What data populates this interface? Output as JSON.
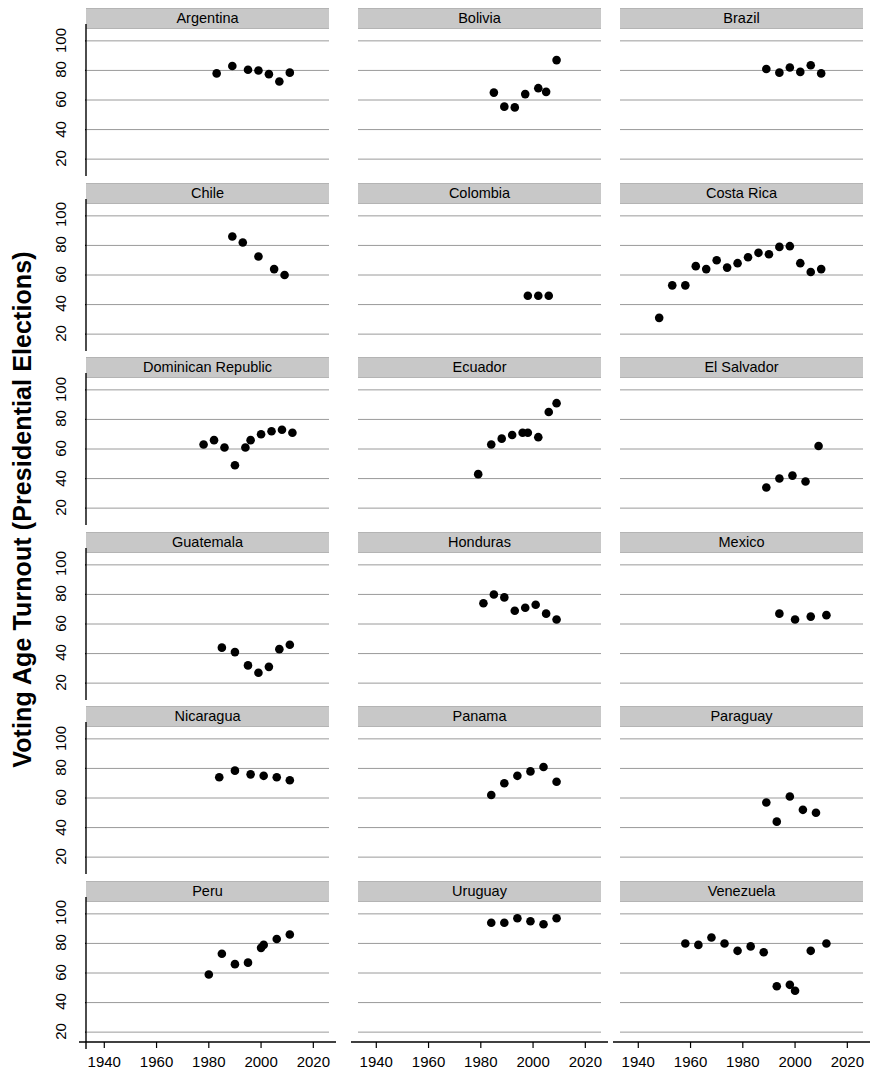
{
  "figure": {
    "ylabel": "Voting Age Turnout (Presidential Elections)",
    "xlabel": "",
    "strip_color": "#c8c8c8",
    "point_color": "#000000",
    "grid_color": "#808080",
    "background": "#ffffff"
  },
  "axis": {
    "y_ticks": [
      "20",
      "40",
      "60",
      "80",
      "100"
    ],
    "x_ticks": [
      "1940",
      "1960",
      "1980",
      "2000",
      "2020"
    ],
    "ylim": [
      14,
      106
    ],
    "xlim": [
      1933,
      2026
    ]
  },
  "chart_data": {
    "type": "scatter",
    "title": "",
    "xlabel": "",
    "ylabel": "Voting Age Turnout (Presidential Elections)",
    "xlim": [
      1933,
      2026
    ],
    "ylim": [
      14,
      106
    ],
    "xticks": [
      1940,
      1960,
      1980,
      2000,
      2020
    ],
    "yticks": [
      20,
      40,
      60,
      80,
      100
    ],
    "grid": true,
    "legend": "none",
    "layout": {
      "rows": 6,
      "cols": 3,
      "panel_order": "row-major"
    },
    "panels": [
      {
        "name": "Argentina",
        "x": [
          1983,
          1989,
          1995,
          1999,
          2003,
          2007,
          2011
        ],
        "y": [
          78,
          83,
          80.5,
          80,
          77.5,
          72.5,
          78.5
        ]
      },
      {
        "name": "Bolivia",
        "x": [
          1985,
          1989,
          1993,
          1997,
          2002,
          2005,
          2009
        ],
        "y": [
          65,
          55.5,
          55,
          64,
          68,
          65.5,
          87
        ]
      },
      {
        "name": "Brazil",
        "x": [
          1989,
          1994,
          1998,
          2002,
          2006,
          2010
        ],
        "y": [
          81,
          78.5,
          82,
          79,
          83.5,
          78
        ]
      },
      {
        "name": "Chile",
        "x": [
          1989,
          1993,
          1999,
          2005,
          2009
        ],
        "y": [
          86,
          82,
          72.5,
          64,
          60
        ]
      },
      {
        "name": "Colombia",
        "x": [
          1998,
          2002,
          2006
        ],
        "y": [
          46,
          46,
          46
        ]
      },
      {
        "name": "Costa Rica",
        "x": [
          1948,
          1953,
          1958,
          1962,
          1966,
          1970,
          1974,
          1978,
          1982,
          1986,
          1990,
          1994,
          1998,
          2002,
          2006,
          2010
        ],
        "y": [
          31,
          53,
          53,
          66,
          64,
          70,
          65,
          68,
          72,
          75,
          74,
          79,
          79.5,
          68,
          62,
          64
        ]
      },
      {
        "name": "Dominican Republic",
        "x": [
          1978,
          1982,
          1986,
          1990,
          1994,
          1996,
          2000,
          2004,
          2008,
          2012
        ],
        "y": [
          63,
          66,
          61,
          49,
          61,
          66,
          70,
          72,
          73,
          71
        ]
      },
      {
        "name": "Ecuador",
        "x": [
          1979,
          1984,
          1988,
          1992,
          1996,
          1998,
          2002,
          2006,
          2009
        ],
        "y": [
          43,
          63,
          67,
          69.5,
          71,
          71,
          68,
          85,
          91
        ]
      },
      {
        "name": "El Salvador",
        "x": [
          1989,
          1994,
          1999,
          2004,
          2009
        ],
        "y": [
          34,
          40,
          42,
          38,
          62
        ]
      },
      {
        "name": "Guatemala",
        "x": [
          1985,
          1990,
          1995,
          1999,
          2003,
          2007,
          2011
        ],
        "y": [
          44,
          41,
          32,
          27,
          31,
          43,
          46
        ]
      },
      {
        "name": "Honduras",
        "x": [
          1981,
          1985,
          1989,
          1993,
          1997,
          2001,
          2005,
          2009
        ],
        "y": [
          74,
          80,
          78,
          69,
          71,
          73,
          67,
          63
        ]
      },
      {
        "name": "Mexico",
        "x": [
          1994,
          2000,
          2006,
          2012
        ],
        "y": [
          67,
          63,
          65,
          66
        ]
      },
      {
        "name": "Nicaragua",
        "x": [
          1984,
          1990,
          1996,
          2001,
          2006,
          2011
        ],
        "y": [
          74,
          78.5,
          76,
          75,
          74,
          72
        ]
      },
      {
        "name": "Panama",
        "x": [
          1984,
          1989,
          1994,
          1999,
          2004,
          2009
        ],
        "y": [
          62,
          70,
          75,
          78,
          81,
          71
        ]
      },
      {
        "name": "Paraguay",
        "x": [
          1989,
          1993,
          1998,
          2003,
          2008
        ],
        "y": [
          57,
          44,
          61,
          52,
          50
        ]
      },
      {
        "name": "Peru",
        "x": [
          1980,
          1985,
          1990,
          1995,
          2000,
          2001,
          2006,
          2011
        ],
        "y": [
          59,
          73,
          66,
          67,
          77,
          79,
          83,
          86
        ]
      },
      {
        "name": "Uruguay",
        "x": [
          1984,
          1989,
          1994,
          1999,
          2004,
          2009
        ],
        "y": [
          94,
          94,
          97,
          95,
          93,
          97
        ]
      },
      {
        "name": "Venezuela",
        "x": [
          1958,
          1963,
          1968,
          1973,
          1978,
          1983,
          1988,
          1993,
          1998,
          2000,
          2006,
          2012
        ],
        "y": [
          80,
          79,
          84,
          80,
          75,
          78,
          74,
          51,
          52,
          48,
          75,
          80
        ]
      }
    ]
  },
  "y_axis_panels": [
    "Argentina",
    "Chile",
    "Dominican Republic",
    "Guatemala",
    "Nicaragua",
    "Peru"
  ],
  "x_axis_row": 5
}
